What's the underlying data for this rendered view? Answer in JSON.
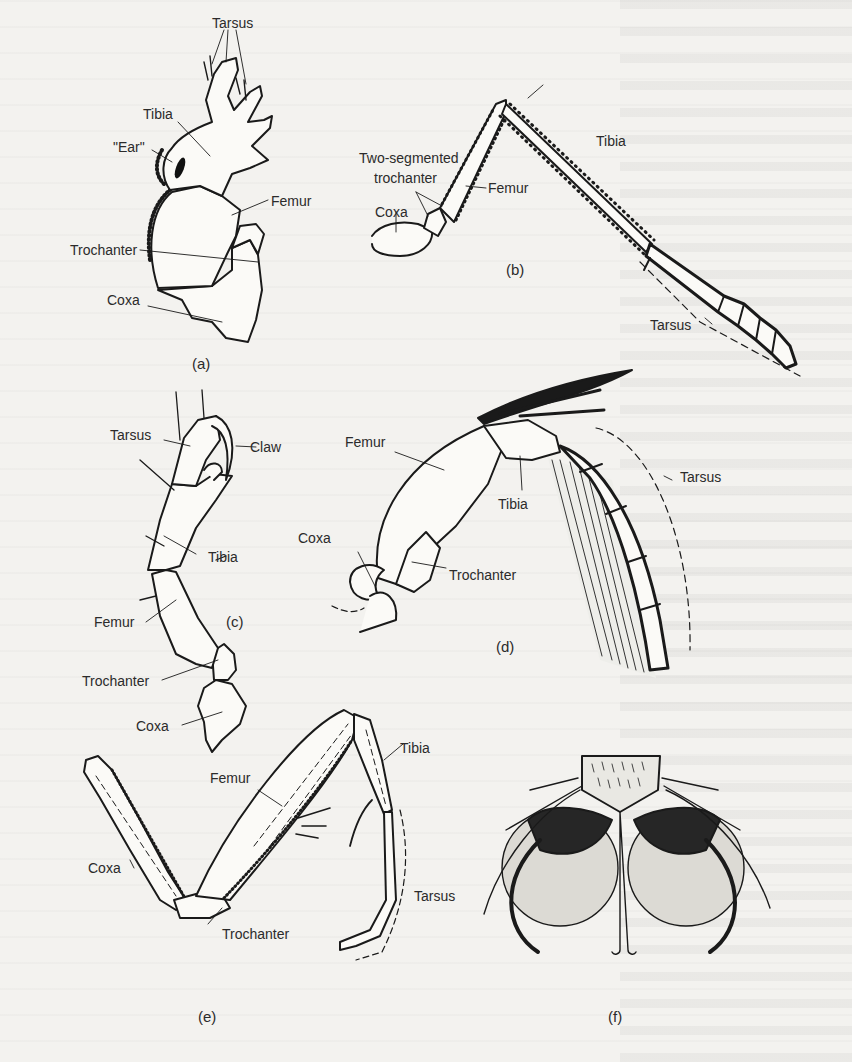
{
  "figure": {
    "panels": [
      {
        "id": "a",
        "caption": "(a)",
        "labels": [
          "Tarsus",
          "Tibia",
          "\"Ear\"",
          "Femur",
          "Trochanter",
          "Coxa"
        ]
      },
      {
        "id": "b",
        "caption": "(b)",
        "labels": [
          "Two-segmented",
          "trochanter",
          "Coxa",
          "Femur",
          "Tibia",
          "Tarsus"
        ]
      },
      {
        "id": "c",
        "caption": "(c)",
        "labels": [
          "Tarsus",
          "Claw",
          "Tibia",
          "Femur",
          "Trochanter",
          "Coxa"
        ]
      },
      {
        "id": "d",
        "caption": "(d)",
        "labels": [
          "Femur",
          "Tibia",
          "Tarsus",
          "Coxa",
          "Trochanter"
        ]
      },
      {
        "id": "e",
        "caption": "(e)",
        "labels": [
          "Femur",
          "Tibia",
          "Coxa",
          "Tarsus",
          "Trochanter"
        ]
      },
      {
        "id": "f",
        "caption": "(f)",
        "labels": []
      }
    ]
  }
}
